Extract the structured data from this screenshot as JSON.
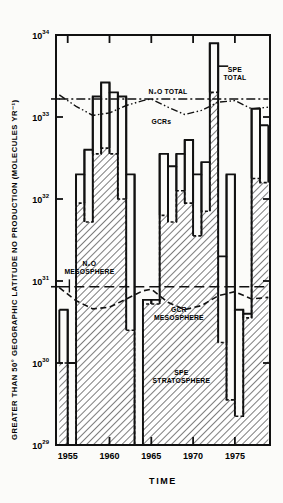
{
  "chart_data": {
    "type": "bar",
    "title": "",
    "ylabel": "GREATER THAN 50° GEOGRAPHIC LATITUDE NO PRODUCTION (MOLECULES YR⁻¹)",
    "xlabel": "TIME",
    "xlim": [
      1953.6,
      1979.2
    ],
    "ylim_log10": [
      29,
      34
    ],
    "y_tick_labels": [
      "10²⁹",
      "10³⁰",
      "10³¹",
      "10³²",
      "10³³",
      "10³⁴"
    ],
    "y_tick_mantissa": "10",
    "y_tick_exponents": [
      "29",
      "30",
      "31",
      "32",
      "33",
      "34"
    ],
    "x_tick_labels": [
      "1955",
      "1960",
      "1965",
      "1970",
      "1975"
    ],
    "x_ticks": [
      1955,
      1960,
      1965,
      1970,
      1975
    ],
    "grid": false,
    "legend_position": "in-plot annotations",
    "annotations": [
      {
        "id": "spe-total",
        "text_line1": "SPE",
        "text_line2": "TOTAL",
        "x": 1975.0,
        "y_log10": 33.55
      },
      {
        "id": "n2o-total",
        "text": "N₂O TOTAL",
        "x": 1967.0,
        "y_log10": 33.28
      },
      {
        "id": "gcrs",
        "text": "GCRs",
        "x": 1966.2,
        "y_log10": 32.92
      },
      {
        "id": "n2o-mesosphere",
        "text_line1": "N₂O",
        "text_line2": "MESOSPHERE",
        "x": 1957.6,
        "y_log10": 31.18
      },
      {
        "id": "gcr-mesosphere",
        "text_line1": "GCR",
        "text_line2": "MESOSPHERE",
        "x": 1968.3,
        "y_log10": 30.62
      },
      {
        "id": "spe-stratosphere",
        "text_line1": "SPE",
        "text_line2": "STRATOSPHERE",
        "x": 1968.6,
        "y_log10": 29.85
      }
    ],
    "series": [
      {
        "name": "SPE TOTAL",
        "style": "solid-step-outline",
        "unit": "log10 molecules/yr",
        "x": [
          1954,
          1955,
          1956,
          1957,
          1958,
          1959,
          1960,
          1961,
          1962,
          1963,
          1964,
          1965,
          1966,
          1967,
          1968,
          1969,
          1970,
          1971,
          1972,
          1973,
          1974,
          1975,
          1976,
          1977,
          1978
        ],
        "values": [
          30.65,
          30.0,
          32.3,
          32.6,
          33.25,
          33.42,
          33.3,
          33.25,
          32.3,
          29.0,
          30.77,
          30.77,
          32.55,
          32.4,
          32.55,
          32.72,
          32.3,
          32.45,
          33.9,
          31.3,
          32.3,
          30.65,
          30.6,
          33.1,
          32.9
        ]
      },
      {
        "name": "SPE STRATOSPHERE",
        "style": "dashed-step-hatched",
        "unit": "log10 molecules/yr",
        "x": [
          1954,
          1955,
          1956,
          1957,
          1958,
          1959,
          1960,
          1961,
          1962,
          1963,
          1964,
          1965,
          1966,
          1967,
          1968,
          1969,
          1970,
          1971,
          1972,
          1973,
          1974,
          1975,
          1976,
          1977,
          1978
        ],
        "values": [
          30.0,
          29.0,
          31.95,
          31.72,
          32.55,
          32.62,
          32.55,
          32.0,
          30.4,
          29.0,
          30.72,
          30.72,
          31.8,
          31.72,
          32.1,
          31.95,
          31.55,
          31.85,
          33.3,
          30.25,
          29.55,
          29.35,
          30.55,
          32.25,
          32.2
        ]
      },
      {
        "name": "N₂O TOTAL",
        "style": "dash-dot-line",
        "unit": "log10 molecules/yr",
        "x": [
          1954,
          1979
        ],
        "values": [
          33.22,
          33.22
        ]
      },
      {
        "name": "GCRs",
        "style": "dash-dot-dot-curve",
        "unit": "log10 molecules/yr",
        "x": [
          1954,
          1956,
          1958,
          1960,
          1962,
          1964,
          1965,
          1967,
          1969,
          1971,
          1973,
          1975,
          1977,
          1979
        ],
        "values": [
          33.27,
          33.13,
          33.02,
          33.05,
          33.14,
          33.2,
          33.22,
          33.12,
          33.03,
          33.08,
          33.18,
          33.2,
          33.1,
          33.12
        ]
      },
      {
        "name": "N₂O MESOSPHERE",
        "style": "long-dashed-line",
        "unit": "log10 molecules/yr",
        "x": [
          1954,
          1979
        ],
        "values": [
          30.93,
          30.93
        ]
      },
      {
        "name": "GCR MESOSPHERE",
        "style": "dashed-curve",
        "unit": "log10 molecules/yr",
        "x": [
          1954,
          1956,
          1958,
          1960,
          1962,
          1964,
          1965,
          1967,
          1969,
          1971,
          1973,
          1975,
          1977,
          1979
        ],
        "values": [
          30.92,
          30.76,
          30.66,
          30.68,
          30.78,
          30.88,
          30.9,
          30.74,
          30.65,
          30.7,
          30.82,
          30.87,
          30.78,
          30.8
        ]
      }
    ]
  }
}
